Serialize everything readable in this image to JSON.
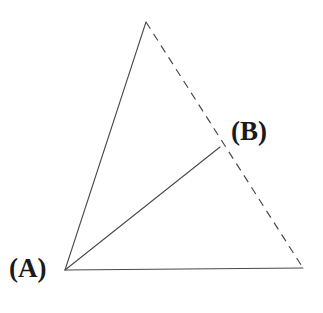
{
  "figure": {
    "background_color": "#ffffff",
    "stroke_color": "#4a4a4a",
    "label_color": "#1a1a1a",
    "stroke_width": 1.1,
    "dash_pattern": "8 6",
    "width": 323,
    "height": 313
  },
  "labels": {
    "a": "(A)",
    "b": "(B)"
  },
  "points": {
    "apex": {
      "name": "apex",
      "x": 146,
      "y": 22
    },
    "a": {
      "name": "A",
      "x": 65,
      "y": 270
    },
    "right": {
      "name": "right",
      "x": 303,
      "y": 268
    },
    "b": {
      "name": "B",
      "x": 220,
      "y": 147
    }
  },
  "segments": [
    {
      "name": "apex-to-a",
      "style": "solid",
      "x1": 146,
      "y1": 22,
      "x2": 65,
      "y2": 270
    },
    {
      "name": "a-to-right",
      "style": "solid",
      "x1": 65,
      "y1": 270,
      "x2": 303,
      "y2": 268
    },
    {
      "name": "a-to-b",
      "style": "solid",
      "x1": 65,
      "y1": 270,
      "x2": 220,
      "y2": 147
    },
    {
      "name": "apex-to-right",
      "style": "dashed",
      "x1": 146,
      "y1": 22,
      "x2": 303,
      "y2": 268
    }
  ]
}
